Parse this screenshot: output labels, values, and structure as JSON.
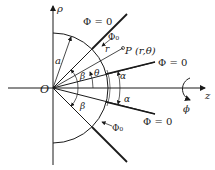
{
  "diagram": {
    "type": "geometry",
    "labels": {
      "rho_axis": "ρ",
      "z_axis": "z",
      "origin": "O",
      "azimuth": "ϕ",
      "radius_a": "a",
      "radius_r": "r",
      "point": "P (r,θ)",
      "alpha_top": "α",
      "alpha_bottom": "α",
      "beta_top": "β",
      "beta_bottom": "β",
      "theta": "θ",
      "phi_zero_outer_top": "Φ = 0",
      "phi_zero_inner_top": "Φ = 0",
      "phi_zero_inner_bottom": "Φ = 0",
      "phi0_top": "Φ₀",
      "phi0_bottom": "Φ₀"
    },
    "colors": {
      "ink": "#1a1a1a",
      "background": "#ffffff"
    }
  }
}
